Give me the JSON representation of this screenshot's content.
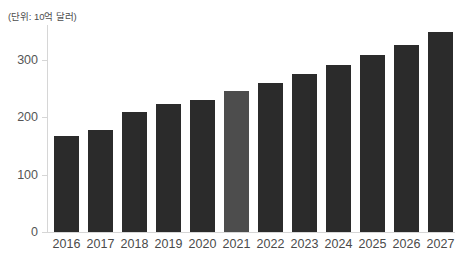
{
  "chart_data": {
    "type": "bar",
    "title": "",
    "subtitle": "",
    "unit_label": "(단위: 10억 달러)",
    "xlabel": "",
    "ylabel": "",
    "categories": [
      "2016",
      "2017",
      "2018",
      "2019",
      "2020",
      "2021",
      "2022",
      "2023",
      "2024",
      "2025",
      "2026",
      "2027"
    ],
    "values": [
      167,
      178,
      209,
      222,
      229,
      245,
      259,
      274,
      290,
      308,
      326,
      347
    ],
    "ylim": [
      0,
      360
    ],
    "yticks": [
      0,
      100,
      200,
      300
    ],
    "ytick_labels": [
      "0",
      "100",
      "200",
      "300"
    ],
    "grid": false,
    "legend": "none",
    "highlight_index": 5,
    "colors": {
      "bar": "#2b2b2b",
      "bar_highlight": "#4d4d4d",
      "axis": "#d6d6d6",
      "tick_text": "#555555",
      "caption_text": "#4d4d4d",
      "background": "#ffffff"
    }
  }
}
